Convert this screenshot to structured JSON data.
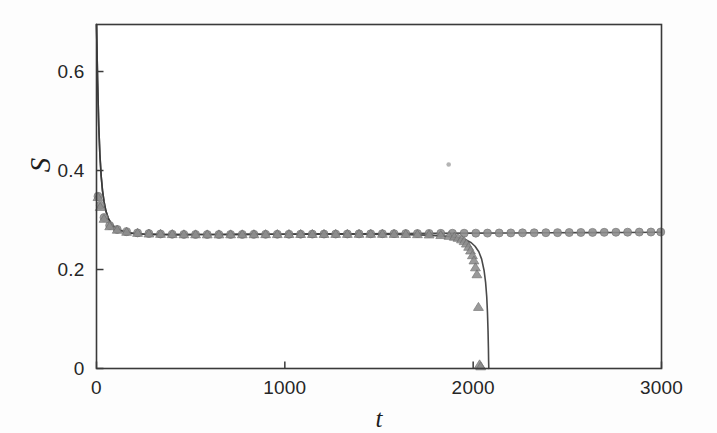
{
  "figure": {
    "background_color": "#fdfdfd",
    "width": 717,
    "height": 433
  },
  "axes": {
    "frame_color": "#3a3a3a",
    "x_title": "t",
    "y_title": "S",
    "x_tick_labels": [
      "0",
      "1000",
      "2000",
      "3000"
    ],
    "y_tick_labels": [
      "0",
      "0.2",
      "0.4",
      "0.6"
    ]
  },
  "chart_data": {
    "type": "line",
    "title": "",
    "xlabel": "t",
    "ylabel": "S",
    "xlim": [
      0,
      3000
    ],
    "ylim": [
      0,
      0.695
    ],
    "xticks": [
      0,
      1000,
      2000,
      3000
    ],
    "yticks": [
      0,
      0.2,
      0.4,
      0.6
    ],
    "grid": false,
    "legend": "none",
    "plateau_value": 0.271,
    "collapse_time_line": 2080,
    "collapse_time_triangles": 2030,
    "series": [
      {
        "name": "solid-curve-survives",
        "style": "line",
        "color": "#3a3a3a",
        "linewidth": 1.6,
        "x": [
          0,
          6,
          12,
          18,
          25,
          32,
          40,
          50,
          62,
          76,
          92,
          110,
          130,
          155,
          185,
          220,
          260,
          300,
          350,
          400,
          470,
          550,
          650,
          760,
          900,
          1050,
          1220,
          1400,
          1600,
          1800,
          2000,
          2200,
          2400,
          2600,
          2800,
          3000
        ],
        "y": [
          0.695,
          0.58,
          0.49,
          0.432,
          0.388,
          0.359,
          0.337,
          0.318,
          0.304,
          0.294,
          0.287,
          0.282,
          0.279,
          0.276,
          0.2735,
          0.2722,
          0.2713,
          0.2709,
          0.2706,
          0.2705,
          0.2705,
          0.2706,
          0.2708,
          0.271,
          0.2713,
          0.2716,
          0.2719,
          0.2723,
          0.2727,
          0.2731,
          0.2735,
          0.2739,
          0.2743,
          0.2746,
          0.2749,
          0.2752
        ]
      },
      {
        "name": "solid-curve-collapses",
        "style": "line",
        "color": "#3a3a3a",
        "linewidth": 1.6,
        "x": [
          0,
          6,
          12,
          18,
          25,
          32,
          40,
          50,
          62,
          76,
          92,
          110,
          130,
          155,
          185,
          220,
          260,
          300,
          350,
          400,
          470,
          550,
          650,
          760,
          900,
          1050,
          1220,
          1400,
          1600,
          1750,
          1850,
          1920,
          1960,
          1990,
          2010,
          2030,
          2045,
          2058,
          2066,
          2072,
          2076,
          2079,
          2081,
          2082,
          2083
        ],
        "y": [
          0.695,
          0.58,
          0.49,
          0.432,
          0.388,
          0.359,
          0.337,
          0.318,
          0.304,
          0.294,
          0.287,
          0.282,
          0.279,
          0.276,
          0.2735,
          0.2722,
          0.2713,
          0.2709,
          0.2706,
          0.2705,
          0.2705,
          0.2706,
          0.2707,
          0.2709,
          0.2711,
          0.2713,
          0.2714,
          0.2713,
          0.2707,
          0.2695,
          0.2675,
          0.264,
          0.26,
          0.254,
          0.247,
          0.236,
          0.221,
          0.198,
          0.174,
          0.145,
          0.112,
          0.076,
          0.041,
          0.015,
          0.0
        ]
      },
      {
        "name": "circle-markers",
        "style": "markers",
        "marker": "circle",
        "color": "#8d8d8d",
        "edge_color": "#6e6e6e",
        "size": 8.0,
        "x": [
          8,
          20,
          40,
          70,
          110,
          160,
          218,
          278,
          340,
          402,
          464,
          526,
          588,
          650,
          712,
          774,
          836,
          898,
          960,
          1022,
          1084,
          1146,
          1208,
          1270,
          1332,
          1394,
          1456,
          1518,
          1580,
          1642,
          1704,
          1766,
          1828,
          1890,
          1952,
          2014,
          2076,
          2138,
          2200,
          2262,
          2324,
          2386,
          2448,
          2510,
          2572,
          2634,
          2696,
          2758,
          2820,
          2882,
          2944,
          2996
        ],
        "y": [
          0.348,
          0.33,
          0.305,
          0.289,
          0.281,
          0.2765,
          0.274,
          0.2726,
          0.2718,
          0.2712,
          0.2709,
          0.2708,
          0.2707,
          0.2707,
          0.2708,
          0.2709,
          0.271,
          0.2711,
          0.2712,
          0.2713,
          0.2714,
          0.2715,
          0.2716,
          0.2717,
          0.2718,
          0.272,
          0.2721,
          0.2723,
          0.2724,
          0.2726,
          0.2727,
          0.2729,
          0.273,
          0.2732,
          0.2733,
          0.2735,
          0.2736,
          0.2738,
          0.2739,
          0.2741,
          0.2742,
          0.2744,
          0.2745,
          0.2747,
          0.2748,
          0.275,
          0.2751,
          0.2753,
          0.2754,
          0.2756,
          0.2757,
          0.2758
        ]
      },
      {
        "name": "triangle-markers",
        "style": "markers",
        "marker": "triangle",
        "color": "#8d8d8d",
        "edge_color": "#6e6e6e",
        "size": 8.5,
        "x": [
          8,
          20,
          40,
          70,
          110,
          160,
          218,
          278,
          340,
          402,
          464,
          526,
          588,
          650,
          712,
          774,
          836,
          898,
          960,
          1022,
          1084,
          1146,
          1208,
          1270,
          1332,
          1394,
          1456,
          1518,
          1580,
          1642,
          1704,
          1766,
          1828,
          1872,
          1900,
          1920,
          1938,
          1952,
          1964,
          1976,
          1986,
          1996,
          2004,
          2012,
          2020,
          2028,
          2034,
          2040
        ],
        "y": [
          0.346,
          0.326,
          0.302,
          0.287,
          0.28,
          0.2758,
          0.2736,
          0.2723,
          0.2716,
          0.2711,
          0.2708,
          0.2707,
          0.2706,
          0.2706,
          0.2707,
          0.2708,
          0.2709,
          0.271,
          0.2711,
          0.2712,
          0.2713,
          0.2713,
          0.2714,
          0.2715,
          0.2715,
          0.2716,
          0.2716,
          0.2716,
          0.2715,
          0.2713,
          0.271,
          0.2704,
          0.2692,
          0.2676,
          0.2658,
          0.2636,
          0.2605,
          0.257,
          0.252,
          0.2455,
          0.238,
          0.2285,
          0.218,
          0.204,
          0.19,
          0.124,
          0.008,
          0.004
        ]
      }
    ],
    "artifacts": [
      {
        "name": "scan-speck",
        "x": 1870,
        "y": 0.412,
        "radius": 2.3,
        "color": "#9b9b9b"
      }
    ]
  }
}
